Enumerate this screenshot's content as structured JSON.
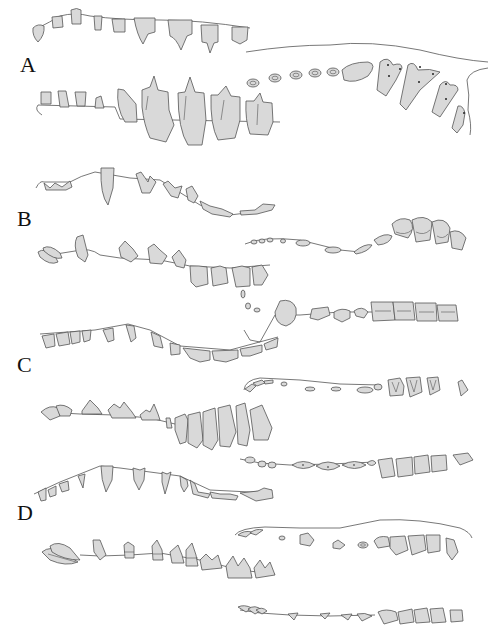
{
  "figure": {
    "fill_color": "#d9d9d9",
    "stroke_color": "#555555",
    "panels": [
      {
        "label": "A",
        "views": [
          "upper lateral",
          "lower lateral",
          "occlusal"
        ]
      },
      {
        "label": "B",
        "views": [
          "upper lateral",
          "occlusal upper",
          "lower lateral",
          "occlusal lower"
        ]
      },
      {
        "label": "C",
        "views": [
          "upper lateral",
          "occlusal upper",
          "lower lateral",
          "occlusal lower"
        ]
      },
      {
        "label": "D",
        "views": [
          "upper lateral",
          "occlusal upper",
          "lower lateral",
          "occlusal lower"
        ]
      }
    ]
  }
}
